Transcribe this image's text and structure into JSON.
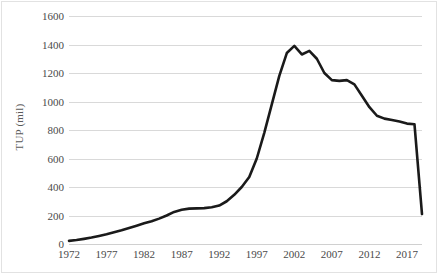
{
  "chart_data": {
    "type": "line",
    "title": "",
    "xlabel": "",
    "ylabel": "TUP (mil)",
    "xlim": [
      1972,
      2019
    ],
    "ylim": [
      0,
      1600
    ],
    "ytick_step": 200,
    "yticks": [
      0,
      200,
      400,
      600,
      800,
      1000,
      1200,
      1400,
      1600
    ],
    "xticks": [
      1972,
      1977,
      1982,
      1987,
      1992,
      1997,
      2002,
      2007,
      2012,
      2017
    ],
    "grid": "horizontal",
    "legend": "none",
    "line_color": "#1a1a1a",
    "line_width": 2.6,
    "series": [
      {
        "name": "TUP",
        "x": [
          1972,
          1973,
          1974,
          1975,
          1976,
          1977,
          1978,
          1979,
          1980,
          1981,
          1982,
          1983,
          1984,
          1985,
          1986,
          1987,
          1988,
          1989,
          1990,
          1991,
          1992,
          1993,
          1994,
          1995,
          1996,
          1997,
          1998,
          1999,
          2000,
          2001,
          2002,
          2003,
          2004,
          2005,
          2006,
          2007,
          2008,
          2009,
          2010,
          2011,
          2012,
          2013,
          2014,
          2015,
          2016,
          2017,
          2018,
          2019
        ],
        "values": [
          22,
          28,
          36,
          45,
          56,
          68,
          82,
          96,
          112,
          128,
          145,
          160,
          178,
          200,
          225,
          240,
          248,
          250,
          252,
          258,
          270,
          300,
          345,
          400,
          470,
          600,
          780,
          980,
          1180,
          1340,
          1390,
          1330,
          1355,
          1300,
          1200,
          1150,
          1145,
          1150,
          1120,
          1040,
          960,
          900,
          880,
          870,
          860,
          845,
          840,
          210
        ]
      }
    ]
  },
  "axes": {
    "y_title": "TUP (mil)",
    "y_tick_labels": [
      "1600",
      "1400",
      "1200",
      "1000",
      "800",
      "600",
      "400",
      "200",
      "0"
    ],
    "x_tick_labels": [
      "1972",
      "1977",
      "1982",
      "1987",
      "1992",
      "1997",
      "2002",
      "2007",
      "2012",
      "2017"
    ]
  }
}
